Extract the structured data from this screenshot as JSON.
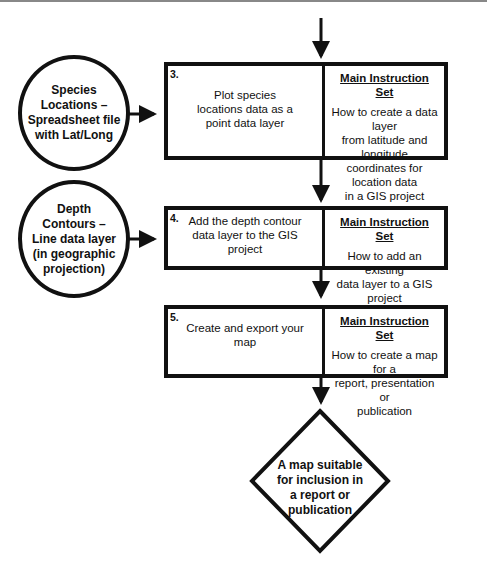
{
  "inputs": [
    {
      "label": "Species Locations – Spreadsheet file with Lat/Long",
      "lines": [
        "Species",
        "Locations –",
        "Spreadsheet file",
        "with Lat/Long"
      ]
    },
    {
      "label": "Depth Contours – Line data layer (in geographic projection)",
      "lines": [
        "Depth",
        "Contours –",
        "Line data layer",
        "(in geographic",
        "projection)"
      ]
    }
  ],
  "steps": [
    {
      "number": "3.",
      "action_lines": [
        "Plot species",
        "locations data as a",
        "point data layer"
      ],
      "instruction_title": "Main Instruction Set",
      "instruction_lines": [
        "How to create a data layer",
        "from latitude and longitude",
        "coordinates for location data",
        "in a GIS project"
      ]
    },
    {
      "number": "4.",
      "action_lines": [
        "Add the depth contour",
        "data layer to the GIS",
        "project"
      ],
      "instruction_title": "Main Instruction Set",
      "instruction_lines": [
        "How to add an existing",
        "data layer to a GIS project"
      ]
    },
    {
      "number": "5.",
      "action_lines": [
        "Create and export your",
        "map"
      ],
      "instruction_title": "Main Instruction Set",
      "instruction_lines": [
        "How to create a map for a",
        "report, presentation or",
        "publication"
      ]
    }
  ],
  "output": {
    "lines": [
      "A map suitable",
      "for inclusion in",
      "a report or",
      "publication"
    ]
  },
  "colors": {
    "stroke": "#111111",
    "background": "#ffffff"
  }
}
